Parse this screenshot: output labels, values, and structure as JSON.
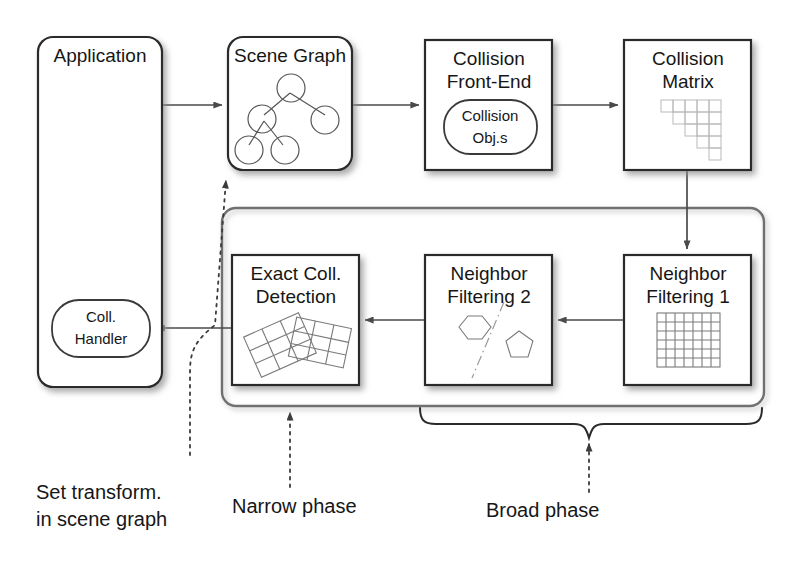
{
  "diagram": {
    "colors": {
      "box_stroke": "#2b2b2b",
      "container_stroke": "#6f6f6f",
      "arrow": "#4a4a4a",
      "text": "#161616",
      "glyph": "#7a7a7a",
      "background": "#ffffff"
    },
    "nodes": {
      "application": {
        "label": "Application",
        "shape": "rounded-rect",
        "x": 38,
        "y": 37,
        "w": 124,
        "h": 350
      },
      "coll_handler": {
        "label_line1": "Coll.",
        "label_line2": "Handler",
        "shape": "pill",
        "x": 52,
        "y": 300,
        "w": 98,
        "h": 57
      },
      "scene_graph": {
        "label": "Scene Graph",
        "shape": "rounded-rect",
        "glyph": "tree-graph-icon",
        "x": 228,
        "y": 37,
        "w": 124,
        "h": 133
      },
      "collision_front_end": {
        "label_line1": "Collision",
        "label_line2": "Front-End",
        "shape": "rect",
        "x": 425,
        "y": 40,
        "w": 127,
        "h": 130
      },
      "collision_objs": {
        "label_line1": "Collision",
        "label_line2": "Obj.s",
        "shape": "pill",
        "x": 444,
        "y": 100,
        "w": 93,
        "h": 54
      },
      "collision_matrix": {
        "label_line1": "Collision",
        "label_line2": "Matrix",
        "shape": "rect",
        "glyph": "triangular-matrix-icon",
        "x": 624,
        "y": 40,
        "w": 127,
        "h": 130
      },
      "neighbor_filtering_1": {
        "label_line1": "Neighbor",
        "label_line2": "Filtering 1",
        "shape": "rect",
        "glyph": "uniform-grid-icon",
        "x": 624,
        "y": 255,
        "w": 127,
        "h": 130
      },
      "neighbor_filtering_2": {
        "label_line1": "Neighbor",
        "label_line2": "Filtering 2",
        "shape": "rect",
        "glyph": "hexagon-pentagon-split-icon",
        "x": 425,
        "y": 255,
        "w": 127,
        "h": 130
      },
      "exact_coll_detection": {
        "label_line1": "Exact Coll.",
        "label_line2": "Detection",
        "shape": "rect",
        "glyph": "overlapping-grids-icon",
        "x": 232,
        "y": 255,
        "w": 127,
        "h": 130
      },
      "pipeline_container": {
        "label": "",
        "shape": "rounded-rect-outline",
        "x": 222,
        "y": 208,
        "w": 542,
        "h": 198
      }
    },
    "captions": {
      "set_transform": {
        "line1": "Set transform.",
        "line2": "in scene graph",
        "x": 36,
        "y": 494
      },
      "narrow_phase": {
        "line1": "Narrow phase",
        "x": 232,
        "y": 508
      },
      "broad_phase": {
        "line1": "Broad phase",
        "x": 486,
        "y": 512
      }
    },
    "connections": [
      {
        "name": "application-to-scene-graph",
        "from": "application",
        "to": "scene_graph",
        "style": "solid-arrow"
      },
      {
        "name": "scene-graph-to-collision-front-end",
        "from": "scene_graph",
        "to": "collision_front_end",
        "style": "solid-arrow"
      },
      {
        "name": "collision-front-end-to-collision-matrix",
        "from": "collision_front_end",
        "to": "collision_matrix",
        "style": "solid-arrow"
      },
      {
        "name": "collision-matrix-to-neighbor-filtering-1",
        "from": "collision_matrix",
        "to": "neighbor_filtering_1",
        "style": "solid-arrow"
      },
      {
        "name": "neighbor-filtering-1-to-neighbor-filtering-2",
        "from": "neighbor_filtering_1",
        "to": "neighbor_filtering_2",
        "style": "solid-arrow"
      },
      {
        "name": "neighbor-filtering-2-to-exact-coll-detection",
        "from": "neighbor_filtering_2",
        "to": "exact_coll_detection",
        "style": "solid-arrow"
      },
      {
        "name": "exact-coll-detection-to-coll-handler",
        "from": "exact_coll_detection",
        "to": "coll_handler",
        "style": "solid-arrow"
      },
      {
        "name": "coll-handler-to-scene-graph-dotted",
        "from": "coll_handler",
        "to": "scene_graph",
        "style": "dotted-arrow"
      }
    ]
  }
}
